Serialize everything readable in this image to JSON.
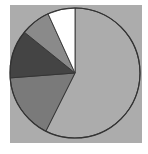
{
  "chart_data": {
    "type": "pie",
    "title": "",
    "start_angle_deg": 0,
    "direction": "clockwise",
    "labels": [
      "Slice 1",
      "Slice 2",
      "Slice 3",
      "Slice 4",
      "Slice 5"
    ],
    "values": [
      57.4,
      16.4,
      12.0,
      7.4,
      6.8
    ],
    "colors": [
      "#acacac",
      "#7a7a7a",
      "#444444",
      "#8a8a8a",
      "#ffffff"
    ],
    "legend": [],
    "data_labels": []
  },
  "style": {
    "background_square_color": "#acacac",
    "outline_color": "#333333",
    "page_background": "#ffffff"
  },
  "geometry": {
    "square": {
      "x": 10,
      "y": 5,
      "width": 132,
      "height": 138
    },
    "center": {
      "x": 75,
      "y": 73
    },
    "radius": 65
  }
}
